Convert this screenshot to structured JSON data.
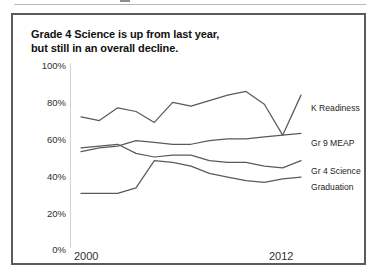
{
  "figure": {
    "title_line1": "Grade 4 Science is up from last year,",
    "title_line2": "but still in an overall decline.",
    "border_color": "#5b5b5b",
    "background": "#ffffff"
  },
  "axes": {
    "y_tick_labels": [
      "100%",
      "80%",
      "60%",
      "40%",
      "20%",
      "0%"
    ],
    "x_tick_labels": [
      "2000",
      "2012"
    ]
  },
  "series_labels": {
    "k_readiness": "K Readiness",
    "gr9_meap": "Gr 9 MEAP",
    "gr4_science": "Gr 4 Science",
    "graduation": "Graduation"
  },
  "chart_data": {
    "type": "line",
    "title": "Grade 4 Science is up from last year, but still in an overall decline.",
    "xlabel": "",
    "ylabel": "",
    "ylim": [
      0,
      100
    ],
    "xlim": [
      2000,
      2012
    ],
    "yticks": [
      0,
      20,
      40,
      60,
      80,
      100
    ],
    "ytick_labels": [
      "0%",
      "20%",
      "40%",
      "60%",
      "80%",
      "100%"
    ],
    "xticks": [
      2000,
      2012
    ],
    "xtick_labels": [
      "2000",
      "2012"
    ],
    "grid": false,
    "legend": "right-inline-labels",
    "line_color": "#5a5a5a",
    "x": [
      2000,
      2001,
      2002,
      2003,
      2004,
      2005,
      2006,
      2007,
      2008,
      2009,
      2010,
      2011,
      2012
    ],
    "series": [
      {
        "name": "K Readiness",
        "values": [
          72,
          70,
          77,
          75,
          69,
          80,
          78,
          81,
          84,
          86,
          79,
          62,
          84
        ]
      },
      {
        "name": "Gr 9 MEAP",
        "values": [
          53,
          55,
          56,
          59,
          58,
          57,
          57,
          59,
          60,
          60,
          61,
          62,
          63
        ]
      },
      {
        "name": "Gr 4 Science",
        "values": [
          55,
          56,
          57,
          52,
          50,
          51,
          51,
          48,
          47,
          47,
          45,
          44,
          48
        ]
      },
      {
        "name": "Graduation",
        "values": [
          30,
          30,
          30,
          33,
          48,
          47,
          45,
          41,
          39,
          37,
          36,
          38,
          39
        ]
      }
    ]
  }
}
